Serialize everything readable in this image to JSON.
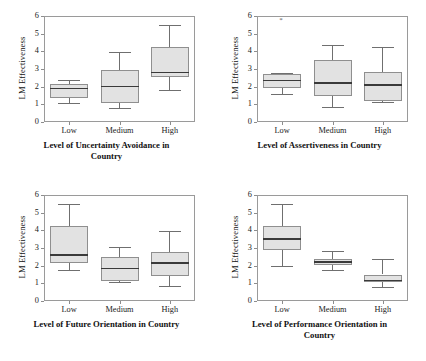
{
  "figure": {
    "layout": "2x2 grid of boxplots",
    "ylabels": [
      "LM Effectiveness",
      "LM Effectiveness",
      "LM Effectiveness",
      "LM Effectiveness"
    ],
    "yticks": [
      "0",
      "1",
      "2",
      "3",
      "4",
      "5",
      "6"
    ],
    "xticks": [
      "Low",
      "Medium",
      "High"
    ]
  },
  "chart_data": [
    {
      "type": "box",
      "title": "",
      "xlabel": "Level of Uncertainty Avoidance in Country",
      "ylabel": "LM Effectiveness",
      "categories": [
        "Low",
        "Medium",
        "High"
      ],
      "ylim": [
        0,
        6
      ],
      "yticks": [
        0,
        1,
        2,
        3,
        4,
        5,
        6
      ],
      "grid": false,
      "legend": "none",
      "boxes": [
        {
          "category": "Low",
          "min": 1.1,
          "q1": 1.35,
          "median": 1.9,
          "q3": 2.15,
          "max": 2.4,
          "outliers": []
        },
        {
          "category": "Medium",
          "min": 0.8,
          "q1": 1.1,
          "median": 2.0,
          "q3": 2.95,
          "max": 3.95,
          "outliers": []
        },
        {
          "category": "High",
          "min": 1.8,
          "q1": 2.55,
          "median": 2.8,
          "q3": 4.25,
          "max": 5.5,
          "outliers": []
        }
      ]
    },
    {
      "type": "box",
      "title": "",
      "xlabel": "Level of Assertiveness in Country",
      "ylabel": "LM Effectiveness",
      "categories": [
        "Low",
        "Medium",
        "High"
      ],
      "ylim": [
        0,
        6
      ],
      "yticks": [
        0,
        1,
        2,
        3,
        4,
        5,
        6
      ],
      "grid": false,
      "legend": "none",
      "boxes": [
        {
          "category": "Low",
          "min": 1.6,
          "q1": 1.95,
          "median": 2.35,
          "q3": 2.72,
          "max": 2.8,
          "outliers": [
            5.75
          ]
        },
        {
          "category": "Medium",
          "min": 0.85,
          "q1": 1.45,
          "median": 2.2,
          "q3": 3.5,
          "max": 4.35,
          "outliers": []
        },
        {
          "category": "High",
          "min": 1.15,
          "q1": 1.17,
          "median": 2.1,
          "q3": 2.85,
          "max": 4.25,
          "outliers": []
        }
      ]
    },
    {
      "type": "box",
      "title": "",
      "xlabel": "Level of Future Orientation in Country",
      "ylabel": "LM Effectiveness",
      "categories": [
        "Low",
        "Medium",
        "High"
      ],
      "ylim": [
        0,
        6
      ],
      "yticks": [
        0,
        1,
        2,
        3,
        4,
        5,
        6
      ],
      "grid": false,
      "legend": "none",
      "boxes": [
        {
          "category": "Low",
          "min": 1.75,
          "q1": 2.15,
          "median": 2.6,
          "q3": 4.25,
          "max": 5.5,
          "outliers": []
        },
        {
          "category": "Medium",
          "min": 1.1,
          "q1": 1.15,
          "median": 1.85,
          "q3": 2.5,
          "max": 3.05,
          "outliers": []
        },
        {
          "category": "High",
          "min": 0.85,
          "q1": 1.4,
          "median": 2.15,
          "q3": 2.8,
          "max": 3.95,
          "outliers": []
        }
      ]
    },
    {
      "type": "box",
      "title": "",
      "xlabel": "Level of Performance Orientation in Country",
      "ylabel": "LM Effectiveness",
      "categories": [
        "Low",
        "Medium",
        "High"
      ],
      "ylim": [
        0,
        6
      ],
      "yticks": [
        0,
        1,
        2,
        3,
        4,
        5,
        6
      ],
      "grid": false,
      "legend": "none",
      "boxes": [
        {
          "category": "Low",
          "min": 2.0,
          "q1": 2.9,
          "median": 3.5,
          "q3": 4.25,
          "max": 5.5,
          "outliers": []
        },
        {
          "category": "Medium",
          "min": 1.75,
          "q1": 2.05,
          "median": 2.2,
          "q3": 2.4,
          "max": 2.85,
          "outliers": []
        },
        {
          "category": "High",
          "min": 0.8,
          "q1": 1.05,
          "median": 1.15,
          "q3": 1.5,
          "max": 2.4,
          "outliers": []
        }
      ]
    }
  ],
  "panels": [
    {
      "id": "uncertainty-avoidance",
      "xlabel_lines": [
        "Level of Uncertainty Avoidance in",
        "Country"
      ]
    },
    {
      "id": "assertiveness",
      "xlabel_lines": [
        "Level of Assertiveness in Country"
      ]
    },
    {
      "id": "future-orientation",
      "xlabel_lines": [
        "Level of Future Orientation in Country"
      ]
    },
    {
      "id": "performance-orientation",
      "xlabel_lines": [
        "Level of Performance Orientation in",
        "Country"
      ]
    }
  ],
  "colors": {
    "box_fill": "#e2e2e2",
    "box_edge": "#8f8f8f",
    "median": "#3a3a3a",
    "whisker": "#6f6f6f",
    "frame": "#9a9a9a",
    "text": "#111111",
    "background": "#ffffff"
  }
}
